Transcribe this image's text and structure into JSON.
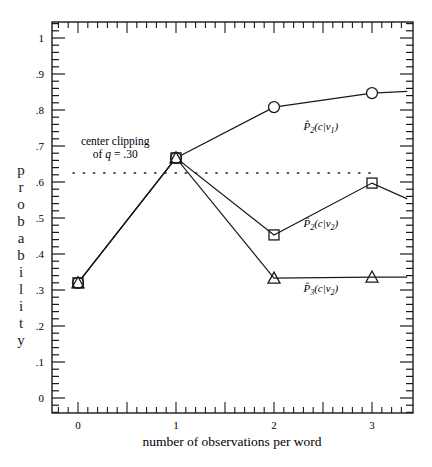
{
  "chart_data": {
    "type": "line",
    "title": "",
    "xlabel": "number of observations per word",
    "ylabel": "probability",
    "xlim": [
      -0.265,
      3.36
    ],
    "ylim": [
      -0.042,
      1.045
    ],
    "grid": false,
    "x_ticks": [
      0,
      1,
      2,
      3
    ],
    "x_tick_labels": [
      "0",
      "1",
      "2",
      "3"
    ],
    "x_minor_step": 0.1,
    "y_ticks": [
      0,
      0.1,
      0.2,
      0.3,
      0.4,
      0.5,
      0.6,
      0.7,
      0.8,
      0.9,
      1.0
    ],
    "y_tick_labels": [
      "0",
      ".1",
      ".2",
      ".3",
      ".4",
      ".5",
      ".6",
      ".7",
      ".8",
      ".9",
      "1"
    ],
    "y_minor_step": 0.02,
    "series": [
      {
        "name": "P̂₂(c|v₁)",
        "label_math": {
          "base": "P̂",
          "sub": "2",
          "args": "(c|v",
          "argsub": "1",
          "close": ")"
        },
        "marker": "circle",
        "x": [
          0,
          1,
          2,
          3,
          3.36
        ],
        "y": [
          0.32,
          0.667,
          0.808,
          0.847,
          0.852
        ],
        "marker_points": 4,
        "label_at": [
          2.3,
          0.745
        ]
      },
      {
        "name": "P̂₂(c|v₂)",
        "label_math": {
          "base": "P̂",
          "sub": "2",
          "args": "(c|v",
          "argsub": "2",
          "close": ")"
        },
        "marker": "square",
        "x": [
          0,
          1,
          2,
          3,
          3.36
        ],
        "y": [
          0.32,
          0.667,
          0.453,
          0.597,
          0.553
        ],
        "marker_points": 4,
        "label_at": [
          2.3,
          0.475
        ]
      },
      {
        "name": "P̂₃(c|v₂)",
        "label_math": {
          "base": "P̂",
          "sub": "3",
          "args": "(c|v",
          "argsub": "2",
          "close": ")"
        },
        "marker": "triangle",
        "x": [
          0,
          1,
          2,
          3,
          3.36
        ],
        "y": [
          0.32,
          0.667,
          0.333,
          0.336,
          0.336
        ],
        "marker_points": 4,
        "label_at": [
          2.3,
          0.295
        ]
      }
    ],
    "reference_line": {
      "label_line1": "center clipping",
      "label_line2_prefix": "of ",
      "label_line2_var": "q",
      "label_line2_suffix": " = .30",
      "y": 0.625,
      "x_range": [
        -0.05,
        3.0
      ],
      "style": "dotted"
    },
    "annotation_at": [
      0.38,
      0.685
    ]
  }
}
